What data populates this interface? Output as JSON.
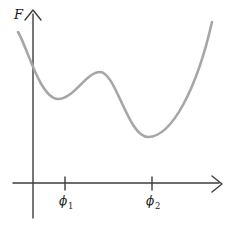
{
  "figure": {
    "y_axis_label": "F",
    "x_tick_labels": [
      {
        "sym": "ϕ",
        "sub": "1"
      },
      {
        "sym": "ϕ",
        "sub": "2"
      }
    ]
  },
  "colors": {
    "axis": "#3d3d3d",
    "curve": "#a6a6a6",
    "text": "#1a1a1a",
    "background": "#ffffff"
  },
  "chart_data": {
    "type": "line",
    "title": "",
    "ylabel": "F",
    "xlabel": "",
    "x_tick_labels": [
      "ϕ1",
      "ϕ2"
    ],
    "axes_numeric": false,
    "units": "arbitrary (qualitative sketch, no numeric scale shown)",
    "series": [
      {
        "name": "F(ϕ)",
        "points_origin_relative_y_up": [
          {
            "x": -15,
            "F": 151,
            "feature": "left end of curve"
          },
          {
            "x": 0,
            "F": 117,
            "feature": "F-axis crossing"
          },
          {
            "x": 25,
            "F": 84,
            "feature": "local minimum (near ϕ1)"
          },
          {
            "x": 67,
            "F": 111,
            "feature": "local maximum"
          },
          {
            "x": 115,
            "F": 46,
            "feature": "global minimum (near ϕ2)"
          },
          {
            "x": 179,
            "F": 161,
            "feature": "right end of curve"
          }
        ],
        "tick_positions_origin_relative": {
          "ϕ1": 32,
          "ϕ2": 119
        }
      }
    ],
    "pixel_geometry": {
      "y_axis": {
        "x1": 33,
        "y1": 14,
        "x2": 33,
        "y2": 218
      },
      "x_axis": {
        "x1": 13,
        "y1": 183,
        "x2": 219,
        "y2": 183
      },
      "y_arrowhead_path": "M 25 20 L 33 10 L 41 20",
      "x_arrowhead_path": "M 212 176 L 222 184 L 212 192",
      "tick_phi1": {
        "x1": 65,
        "y1": 177,
        "x2": 65,
        "y2": 190
      },
      "tick_phi2": {
        "x1": 152,
        "y1": 177,
        "x2": 152,
        "y2": 190
      },
      "curve_path": "M 18 32 C 27 46 40 99 58 99 C 74 99 86 72 100 72 C 116 72 128 137 148 137 C 172 137 197 88 212 22",
      "axis_stroke_width": 1.4,
      "curve_stroke_width": 2.6,
      "labels": {
        "f": {
          "x": 14,
          "y": 19
        },
        "phi1": {
          "x": 59,
          "y": 205
        },
        "phi1_sub": {
          "x": 68,
          "y": 209
        },
        "phi2": {
          "x": 146,
          "y": 205
        },
        "phi2_sub": {
          "x": 155,
          "y": 209
        }
      }
    }
  }
}
